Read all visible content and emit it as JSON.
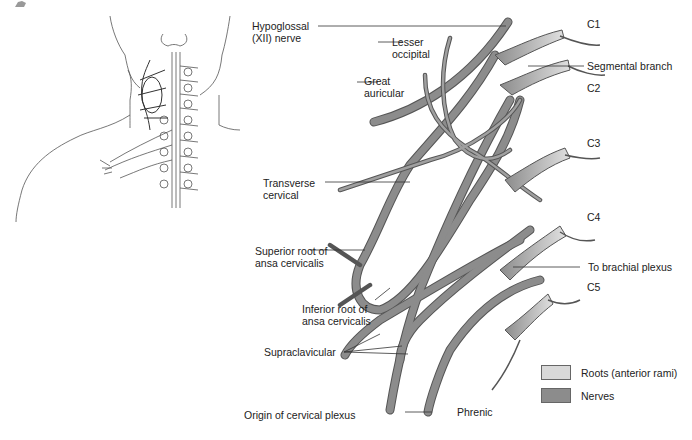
{
  "figure": {
    "caption": "Origin of cervical plexus",
    "colors": {
      "roots": "#d9d9d9",
      "nerves": "#8c8c8c",
      "nerve_outline": "#555555",
      "line": "#333333"
    }
  },
  "labels": {
    "hypoglossal": [
      "Hypoglossal",
      "(XII) nerve"
    ],
    "lesser_occipital": [
      "Lesser",
      "occipital"
    ],
    "great_auricular": [
      "Great",
      "auricular"
    ],
    "transverse_cervical": [
      "Transverse",
      "cervical"
    ],
    "superior_root": [
      "Superior root of",
      "ansa cervicalis"
    ],
    "inferior_root": [
      "Inferior root of",
      "ansa cervicalis"
    ],
    "supraclavicular": "Supraclavicular",
    "phrenic": "Phrenic",
    "segmental_branch": "Segmental branch",
    "to_brachial_plexus": "To brachial plexus",
    "c1": "C1",
    "c2": "C2",
    "c3": "C3",
    "c4": "C4",
    "c5": "C5"
  },
  "legend": [
    {
      "label": "Roots (anterior rami)",
      "color": "#d9d9d9"
    },
    {
      "label": "Nerves",
      "color": "#8c8c8c"
    }
  ]
}
